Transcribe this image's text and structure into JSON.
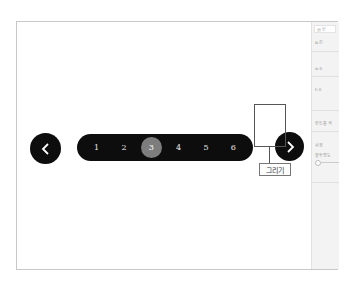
{
  "pager": {
    "prev_icon": "chevron-left-icon",
    "next_icon": "chevron-right-icon",
    "pages": [
      "1",
      "2",
      "3",
      "4",
      "5",
      "6"
    ],
    "active_page": "3"
  },
  "callout": {
    "label": "그리기"
  },
  "side_panel": {
    "top_button": "▤ 반",
    "copy_row": "⧉ 간",
    "width_field": "w 0",
    "height_field": "h 0",
    "control_color": "컨트롤 색",
    "section": "사정",
    "opacity_label": "불투명도"
  },
  "colors": {
    "control_bg": "#0d0d0d",
    "active_page": "#7d7d7d",
    "panel_bg": "#f3f3f3"
  }
}
